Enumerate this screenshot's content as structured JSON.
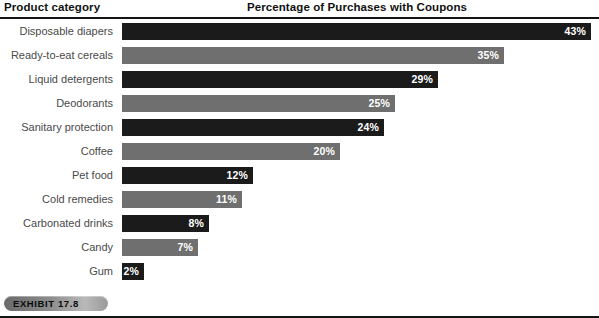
{
  "header": {
    "category_header": "Product category",
    "chart_title": "Percentage of Purchases with Coupons"
  },
  "badge": {
    "label": "EXHIBIT 17.8"
  },
  "colors": {
    "bar_dark": "#1b1b1b",
    "bar_light": "#6f6f6f",
    "label_text": "#4a4a4a",
    "rule": "#141414",
    "value_text": "#ffffff"
  },
  "chart_data": {
    "type": "bar",
    "orientation": "horizontal",
    "title": "Percentage of Purchases with Coupons",
    "xlabel": "",
    "ylabel": "Product category",
    "xlim": [
      0,
      43
    ],
    "grid": false,
    "legend": false,
    "categories": [
      "Disposable diapers",
      "Ready-to-eat cereals",
      "Liquid detergents",
      "Deodorants",
      "Sanitary protection",
      "Coffee",
      "Pet food",
      "Cold remedies",
      "Carbonated drinks",
      "Candy",
      "Gum"
    ],
    "values": [
      43,
      35,
      29,
      25,
      24,
      20,
      12,
      11,
      8,
      7,
      2
    ],
    "value_labels": [
      "43%",
      "35%",
      "29%",
      "25%",
      "24%",
      "20%",
      "12%",
      "11%",
      "8%",
      "7%",
      "2%"
    ],
    "bar_shades": [
      "dark",
      "light",
      "dark",
      "light",
      "dark",
      "light",
      "dark",
      "light",
      "dark",
      "light",
      "dark"
    ]
  }
}
